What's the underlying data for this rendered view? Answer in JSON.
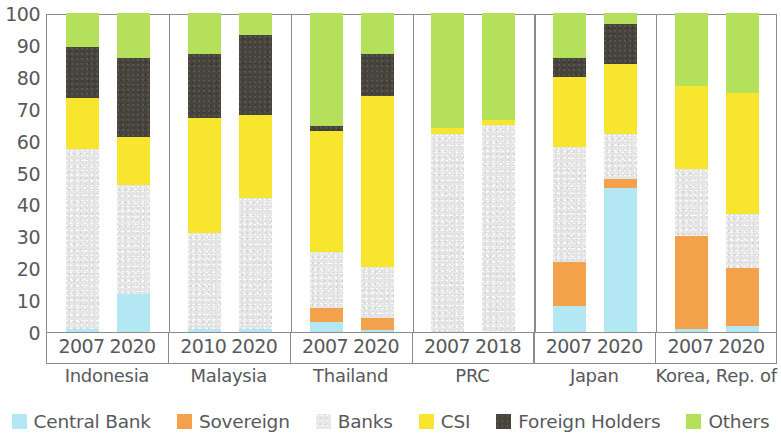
{
  "chart_data": {
    "type": "bar",
    "subtype": "stacked-bar-100",
    "title": "",
    "xlabel": "",
    "ylabel": "",
    "ylim": [
      0,
      100
    ],
    "yticks": [
      0,
      10,
      20,
      30,
      40,
      50,
      60,
      70,
      80,
      90,
      100
    ],
    "grid": false,
    "legend_position": "bottom",
    "categories": [
      "Indonesia 2007",
      "Indonesia 2020",
      "Malaysia 2010",
      "Malaysia 2020",
      "Thailand 2007",
      "Thailand 2020",
      "PRC 2007",
      "PRC 2018",
      "Japan 2007",
      "Japan 2020",
      "Korea, Rep. of 2007",
      "Korea, Rep. of 2020"
    ],
    "series": [
      {
        "name": "Central Bank",
        "color": "#b5e8f5",
        "values": [
          1.0,
          12.0,
          1.0,
          1.0,
          3.0,
          0.5,
          0.0,
          0.0,
          8.0,
          45.0,
          1.0,
          2.0
        ]
      },
      {
        "name": "Sovereign",
        "color": "#f3a košt",
        "values": [
          0,
          0,
          0,
          0,
          0,
          0,
          0,
          0,
          0,
          0,
          0,
          0
        ]
      },
      {
        "name": "Banks",
        "color": "#e6e6e6",
        "values": [
          56.5,
          34.0,
          30.0,
          41.0,
          17.5,
          16.0,
          62.0,
          65.0,
          36.0,
          14.0,
          21.0,
          17.0
        ]
      },
      {
        "name": "CSI",
        "color": "#f7e531",
        "values": [
          16.0,
          15.0,
          36.0,
          26.0,
          39.5,
          53.5,
          2.0,
          1.5,
          22.0,
          22.0,
          26.0,
          38.0
        ]
      },
      {
        "name": "Foreign Holders",
        "color": "#47433d",
        "values": [
          16.0,
          25.0,
          20.0,
          25.0,
          1.0,
          13.0,
          0.0,
          0.0,
          6.0,
          12.5,
          0.0,
          0.0
        ]
      },
      {
        "name": "Others",
        "color": "#b5e05a",
        "values": [
          10.5,
          14.0,
          13.0,
          7.0,
          35.5,
          12.5,
          36.0,
          33.5,
          14.0,
          3.5,
          23.0,
          25.0
        ]
      }
    ]
  },
  "axis": {
    "y_ticks": [
      "100",
      "90",
      "80",
      "70",
      "60",
      "50",
      "40",
      "30",
      "20",
      "10",
      "0"
    ]
  },
  "groups": [
    {
      "name": "Indonesia",
      "bars": [
        {
          "year": "2007",
          "segments": [
            {
              "key": "central",
              "value": 1.0,
              "from": 0.0,
              "to": 1.0
            },
            {
              "key": "sovereign",
              "value": 0.0,
              "from": 1.0,
              "to": 1.0
            },
            {
              "key": "banks",
              "value": 56.5,
              "from": 1.0,
              "to": 57.5
            },
            {
              "key": "csi",
              "value": 16.0,
              "from": 57.5,
              "to": 73.5
            },
            {
              "key": "foreign",
              "value": 16.0,
              "from": 73.5,
              "to": 89.5
            },
            {
              "key": "others",
              "value": 10.5,
              "from": 89.5,
              "to": 100
            }
          ]
        },
        {
          "year": "2020",
          "segments": [
            {
              "key": "central",
              "value": 12.0,
              "from": 0.0,
              "to": 12.0
            },
            {
              "key": "sovereign",
              "value": 0.0,
              "from": 12.0,
              "to": 12.0
            },
            {
              "key": "banks",
              "value": 34.0,
              "from": 12.0,
              "to": 46.0
            },
            {
              "key": "csi",
              "value": 15.0,
              "from": 46.0,
              "to": 61.0
            },
            {
              "key": "foreign",
              "value": 25.0,
              "from": 61.0,
              "to": 86.0
            },
            {
              "key": "others",
              "value": 14.0,
              "from": 86.0,
              "to": 100
            }
          ]
        }
      ]
    },
    {
      "name": "Malaysia",
      "bars": [
        {
          "year": "2010",
          "segments": [
            {
              "key": "central",
              "value": 1.0,
              "from": 0.0,
              "to": 1.0
            },
            {
              "key": "sovereign",
              "value": 0.0,
              "from": 1.0,
              "to": 1.0
            },
            {
              "key": "banks",
              "value": 30.0,
              "from": 1.0,
              "to": 31.0
            },
            {
              "key": "csi",
              "value": 36.0,
              "from": 31.0,
              "to": 67.0
            },
            {
              "key": "foreign",
              "value": 20.0,
              "from": 67.0,
              "to": 87.0
            },
            {
              "key": "others",
              "value": 13.0,
              "from": 87.0,
              "to": 100
            }
          ]
        },
        {
          "year": "2020",
          "segments": [
            {
              "key": "central",
              "value": 1.0,
              "from": 0.0,
              "to": 1.0
            },
            {
              "key": "sovereign",
              "value": 0.0,
              "from": 1.0,
              "to": 1.0
            },
            {
              "key": "banks",
              "value": 41.0,
              "from": 1.0,
              "to": 42.0
            },
            {
              "key": "csi",
              "value": 26.0,
              "from": 42.0,
              "to": 68.0
            },
            {
              "key": "foreign",
              "value": 25.0,
              "from": 68.0,
              "to": 93.0
            },
            {
              "key": "others",
              "value": 7.0,
              "from": 93.0,
              "to": 100
            }
          ]
        }
      ]
    },
    {
      "name": "Thailand",
      "bars": [
        {
          "year": "2007",
          "segments": [
            {
              "key": "central",
              "value": 3.0,
              "from": 0.0,
              "to": 3.0
            },
            {
              "key": "sovereign",
              "value": 4.5,
              "from": 3.0,
              "to": 7.5
            },
            {
              "key": "banks",
              "value": 17.5,
              "from": 7.5,
              "to": 25.0
            },
            {
              "key": "csi",
              "value": 38.0,
              "from": 25.0,
              "to": 63.0
            },
            {
              "key": "foreign",
              "value": 1.5,
              "from": 63.0,
              "to": 64.5
            },
            {
              "key": "others",
              "value": 35.5,
              "from": 64.5,
              "to": 100
            }
          ]
        },
        {
          "year": "2020",
          "segments": [
            {
              "key": "central",
              "value": 0.5,
              "from": 0.0,
              "to": 0.5
            },
            {
              "key": "sovereign",
              "value": 4.0,
              "from": 0.5,
              "to": 4.5
            },
            {
              "key": "banks",
              "value": 16.0,
              "from": 4.5,
              "to": 20.5
            },
            {
              "key": "csi",
              "value": 53.5,
              "from": 20.5,
              "to": 74.0
            },
            {
              "key": "foreign",
              "value": 13.0,
              "from": 74.0,
              "to": 87.0
            },
            {
              "key": "others",
              "value": 13.0,
              "from": 87.0,
              "to": 100
            }
          ]
        }
      ]
    },
    {
      "name": "PRC",
      "bars": [
        {
          "year": "2007",
          "segments": [
            {
              "key": "central",
              "value": 0.0,
              "from": 0.0,
              "to": 0.0
            },
            {
              "key": "sovereign",
              "value": 0.0,
              "from": 0.0,
              "to": 0.0
            },
            {
              "key": "banks",
              "value": 62.0,
              "from": 0.0,
              "to": 62.0
            },
            {
              "key": "csi",
              "value": 2.0,
              "from": 62.0,
              "to": 64.0
            },
            {
              "key": "foreign",
              "value": 0.0,
              "from": 64.0,
              "to": 64.0
            },
            {
              "key": "others",
              "value": 36.0,
              "from": 64.0,
              "to": 100
            }
          ]
        },
        {
          "year": "2018",
          "segments": [
            {
              "key": "central",
              "value": 0.0,
              "from": 0.0,
              "to": 0.0
            },
            {
              "key": "sovereign",
              "value": 0.0,
              "from": 0.0,
              "to": 0.0
            },
            {
              "key": "banks",
              "value": 65.0,
              "from": 0.0,
              "to": 65.0
            },
            {
              "key": "csi",
              "value": 1.5,
              "from": 65.0,
              "to": 66.5
            },
            {
              "key": "foreign",
              "value": 0.0,
              "from": 66.5,
              "to": 66.5
            },
            {
              "key": "others",
              "value": 33.5,
              "from": 66.5,
              "to": 100
            }
          ]
        }
      ]
    },
    {
      "name": "Japan",
      "bars": [
        {
          "year": "2007",
          "segments": [
            {
              "key": "central",
              "value": 8.0,
              "from": 0.0,
              "to": 8.0
            },
            {
              "key": "sovereign",
              "value": 14.0,
              "from": 8.0,
              "to": 22.0
            },
            {
              "key": "banks",
              "value": 36.0,
              "from": 22.0,
              "to": 58.0
            },
            {
              "key": "csi",
              "value": 22.0,
              "from": 58.0,
              "to": 80.0
            },
            {
              "key": "foreign",
              "value": 6.0,
              "from": 80.0,
              "to": 86.0
            },
            {
              "key": "others",
              "value": 14.0,
              "from": 86.0,
              "to": 100
            }
          ]
        },
        {
          "year": "2020",
          "segments": [
            {
              "key": "central",
              "value": 45.0,
              "from": 0.0,
              "to": 45.0
            },
            {
              "key": "sovereign",
              "value": 3.0,
              "from": 45.0,
              "to": 48.0
            },
            {
              "key": "banks",
              "value": 14.0,
              "from": 48.0,
              "to": 62.0
            },
            {
              "key": "csi",
              "value": 22.0,
              "from": 62.0,
              "to": 84.0
            },
            {
              "key": "foreign",
              "value": 12.5,
              "from": 84.0,
              "to": 96.5
            },
            {
              "key": "others",
              "value": 3.5,
              "from": 96.5,
              "to": 100
            }
          ]
        }
      ]
    },
    {
      "name": "Korea, Rep. of",
      "bars": [
        {
          "year": "2007",
          "segments": [
            {
              "key": "central",
              "value": 1.0,
              "from": 0.0,
              "to": 1.0
            },
            {
              "key": "sovereign",
              "value": 29.0,
              "from": 1.0,
              "to": 30.0
            },
            {
              "key": "banks",
              "value": 21.0,
              "from": 30.0,
              "to": 51.0
            },
            {
              "key": "csi",
              "value": 26.0,
              "from": 51.0,
              "to": 77.0
            },
            {
              "key": "foreign",
              "value": 0.0,
              "from": 77.0,
              "to": 77.0
            },
            {
              "key": "others",
              "value": 23.0,
              "from": 77.0,
              "to": 100
            }
          ]
        },
        {
          "year": "2020",
          "segments": [
            {
              "key": "central",
              "value": 2.0,
              "from": 0.0,
              "to": 2.0
            },
            {
              "key": "sovereign",
              "value": 18.0,
              "from": 2.0,
              "to": 20.0
            },
            {
              "key": "banks",
              "value": 17.0,
              "from": 20.0,
              "to": 37.0
            },
            {
              "key": "csi",
              "value": 38.0,
              "from": 37.0,
              "to": 75.0
            },
            {
              "key": "foreign",
              "value": 0.0,
              "from": 75.0,
              "to": 75.0
            },
            {
              "key": "others",
              "value": 25.0,
              "from": 75.0,
              "to": 100
            }
          ]
        }
      ]
    }
  ],
  "legend": {
    "items": [
      {
        "label": "Central Bank",
        "key": "central",
        "color": "#b5e8f5"
      },
      {
        "label": "Sovereign",
        "key": "sovereign",
        "color": "#f5a council"
      },
      {
        "label": "Banks",
        "key": "banks",
        "color": "#e6e6e6"
      },
      {
        "label": "CSI",
        "key": "csi",
        "color": "#f7e531"
      },
      {
        "label": "Foreign Holders",
        "key": "foreign",
        "color": "#47433d"
      },
      {
        "label": "Others",
        "key": "others",
        "color": "#b5e05a"
      }
    ]
  },
  "colors": {
    "central": "#b4e7f4",
    "sovereign": "#f5a council",
    "sovereign_hex": "#f4a14c",
    "banks": "#e6e6e6",
    "csi": "#f8e52e",
    "foreign": "#47433d",
    "others": "#b4e05c",
    "axis": "#8a8c8e",
    "text": "#58595b"
  }
}
